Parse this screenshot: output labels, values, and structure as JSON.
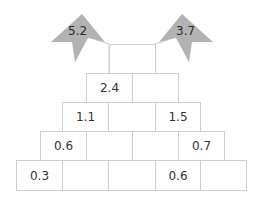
{
  "flags": {
    "left": {
      "value": "5.2",
      "color": "#b3b3b3"
    },
    "right": {
      "value": "3.7",
      "color": "#b3b3b3"
    }
  },
  "pyramid": {
    "rows": [
      [
        "",
        "",
        "",
        "",
        ""
      ],
      [
        "",
        "",
        "",
        ""
      ],
      [
        "",
        "",
        ""
      ],
      [
        "",
        ""
      ],
      [
        ""
      ]
    ],
    "row5": [
      "0.3",
      "",
      "",
      "0.6",
      ""
    ],
    "row4": [
      "0.6",
      "",
      "",
      "0.7"
    ],
    "row3": [
      "1.1",
      "",
      "1.5"
    ],
    "row2": [
      "2.4",
      ""
    ],
    "row1": [
      ""
    ]
  },
  "colors": {
    "border": "#cfcfcf",
    "flag": "#b3b3b3",
    "text": "#333333"
  }
}
